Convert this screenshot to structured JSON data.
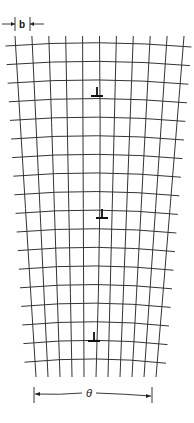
{
  "figure": {
    "burgers_label": "b",
    "angle_label": "θ",
    "dislocation_symbol": "edge-dislocation-⊥",
    "dislocation_count": 3,
    "vertical_line_count": 11,
    "horizontal_line_count": 18
  }
}
